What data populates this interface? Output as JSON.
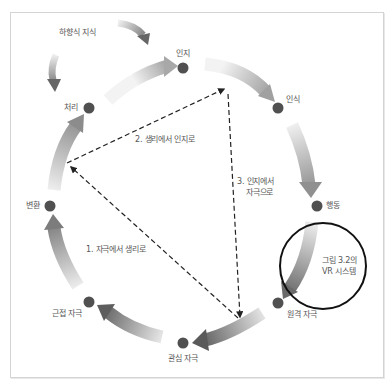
{
  "diagram": {
    "type": "cycle-with-triangle",
    "top_label": "하향식 지식",
    "nodes": [
      {
        "id": "cognition",
        "label": "인지",
        "x": 183,
        "y": 68
      },
      {
        "id": "perception",
        "label": "인식",
        "x": 278,
        "y": 108
      },
      {
        "id": "action",
        "label": "행동",
        "x": 317,
        "y": 206
      },
      {
        "id": "distal",
        "label": "원격 자극",
        "x": 278,
        "y": 303
      },
      {
        "id": "attended",
        "label": "관심 자극",
        "x": 183,
        "y": 343
      },
      {
        "id": "proximal",
        "label": "근접 자극",
        "x": 89,
        "y": 302
      },
      {
        "id": "transduction",
        "label": "변환",
        "x": 50,
        "y": 206
      },
      {
        "id": "processing",
        "label": "처리",
        "x": 89,
        "y": 108
      }
    ],
    "triangle_edges": [
      {
        "label": "1. 자극에서 생리로"
      },
      {
        "label": "2. 생리에서 인지로"
      },
      {
        "label": "3. 인지에서",
        "label2": "자극으로"
      }
    ],
    "highlight_circle": {
      "line1": "그림 3.2의",
      "line2": "VR 시스템"
    },
    "colors": {
      "node": "#505050",
      "arrow_dark": "#6e6e6e",
      "arrow_light": "#f2f2f2",
      "dash": "#222222",
      "circle": "#111111"
    }
  }
}
